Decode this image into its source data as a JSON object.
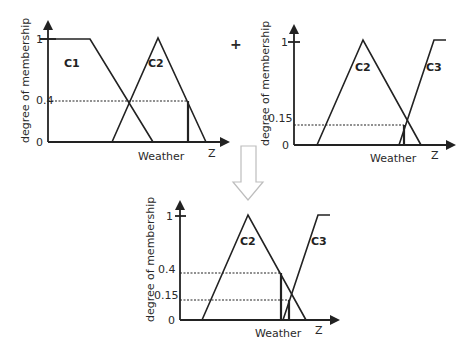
{
  "diagram": {
    "operator": "+",
    "charts": [
      {
        "id": "top-left",
        "ylabel": "degree of membership",
        "xlabel": "Weather",
        "x_axis_var": "Z",
        "ticks": {
          "one": "1",
          "zero": "0",
          "cut": "0.4"
        },
        "sets": [
          {
            "name": "C1"
          },
          {
            "name": "C2"
          }
        ]
      },
      {
        "id": "top-right",
        "ylabel": "degree of membership",
        "xlabel": "Weather",
        "x_axis_var": "Z",
        "ticks": {
          "one": "1",
          "zero": "0",
          "cut": "0.15"
        },
        "sets": [
          {
            "name": "C2"
          },
          {
            "name": "C3"
          }
        ]
      },
      {
        "id": "bottom",
        "ylabel": "degree of membership",
        "xlabel": "Weather",
        "x_axis_var": "Z",
        "ticks": {
          "one": "1",
          "zero": "0",
          "cut_high": "0.4",
          "cut_low": "0.15"
        },
        "sets": [
          {
            "name": "C2"
          },
          {
            "name": "C3"
          }
        ]
      }
    ],
    "arrow": "down-arrow"
  }
}
